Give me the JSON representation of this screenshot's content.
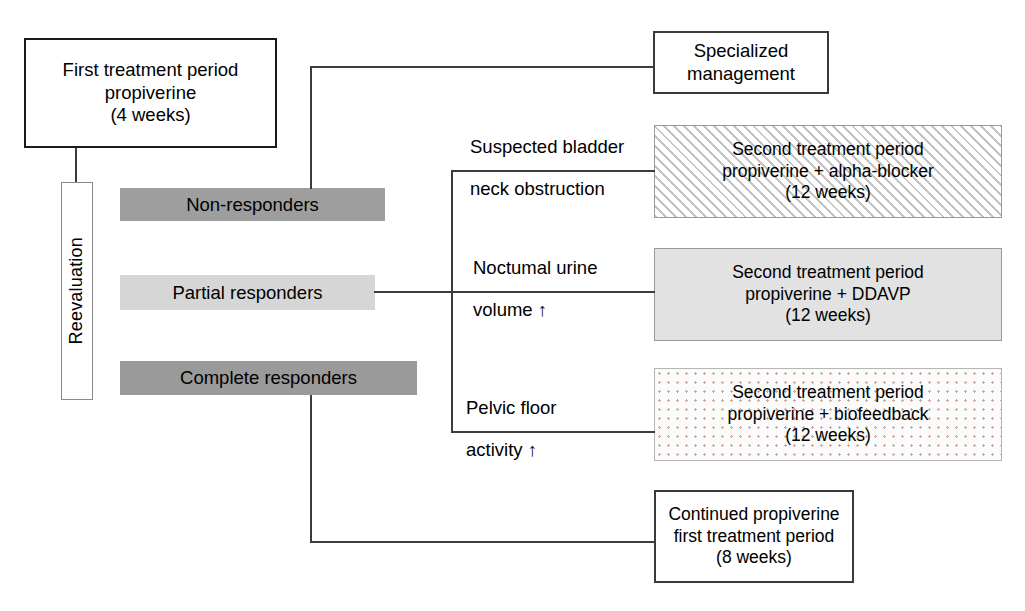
{
  "diagram": {
    "first_treatment": {
      "label": "First treatment period\npropiverine\n(4 weeks)"
    },
    "reevaluation": {
      "label": "Reevaluation"
    },
    "responders": [
      {
        "label": "Non-responders",
        "fill": "#9e9e9e"
      },
      {
        "label": "Partial responders",
        "fill": "#d6d6d6"
      },
      {
        "label": "Complete responders",
        "fill": "#9a9a9a"
      }
    ],
    "criteria": [
      {
        "line1": "Suspected bladder",
        "line2": "neck obstruction"
      },
      {
        "line1": "Noctumal urine",
        "line2": "volume  ↑"
      },
      {
        "line1": "Pelvic floor",
        "line2": "activity  ↑"
      }
    ],
    "outcomes": {
      "specialized": "Specialized\nmanagement",
      "alpha_blocker": "Second treatment period\npropiverine + alpha-blocker\n(12 weeks)",
      "ddavp": "Second treatment period\npropiverine + DDAVP\n(12 weeks)",
      "biofeedback": "Second treatment period\npropiverine + biofeedback\n(12 weeks)",
      "continued": "Continued propiverine\nfirst treatment period\n(8 weeks)"
    }
  }
}
